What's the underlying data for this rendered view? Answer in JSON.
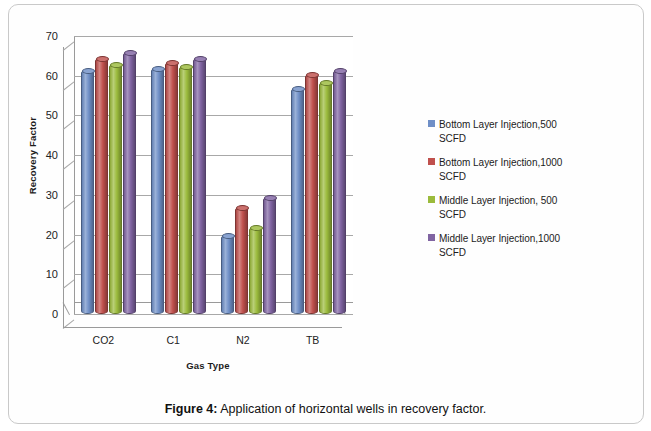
{
  "chart_data": {
    "type": "bar",
    "title": "",
    "xlabel": "Gas Type",
    "ylabel": "Recovery Factor",
    "categories": [
      "CO2",
      "C1",
      "N2",
      "TB"
    ],
    "ylim": [
      0,
      70
    ],
    "ytick_values": [
      70,
      60,
      50,
      40,
      30,
      20,
      10,
      0
    ],
    "ytick_labels": [
      "70",
      "60",
      "50",
      "40",
      "30",
      "20",
      "10",
      "0"
    ],
    "grid": true,
    "legend_position": "right",
    "style": "3d-cylinder-clustered-column",
    "series": [
      {
        "name": "Bottom Layer Injection,500 SCFD",
        "color": "#6f8fc7",
        "values": [
          61.5,
          62,
          20,
          57
        ]
      },
      {
        "name": "Bottom Layer Injection,1000 SCFD",
        "color": "#c0504d",
        "values": [
          64.5,
          63.5,
          27,
          60.5
        ]
      },
      {
        "name": "Middle Layer Injection, 500 SCFD",
        "color": "#9bbb3c",
        "values": [
          63,
          62.5,
          22,
          58.5
        ]
      },
      {
        "name": "Middle Layer Injection,1000 SCFD",
        "color": "#8064a2",
        "values": [
          66,
          64.5,
          29.5,
          61.5
        ]
      }
    ]
  },
  "legend": {
    "entries": [
      {
        "line1": "Bottom Layer Injection,500",
        "line2": "SCFD",
        "color": "#6f8fc7"
      },
      {
        "line1": "Bottom Layer Injection,1000",
        "line2": "SCFD",
        "color": "#c0504d"
      },
      {
        "line1": "Middle Layer Injection, 500",
        "line2": "SCFD",
        "color": "#9bbb3c"
      },
      {
        "line1": "Middle Layer Injection,1000",
        "line2": "SCFD",
        "color": "#8064a2"
      }
    ]
  },
  "caption": {
    "figure_number": "Figure 4:",
    "text": " Application of horizontal wells in recovery factor."
  }
}
